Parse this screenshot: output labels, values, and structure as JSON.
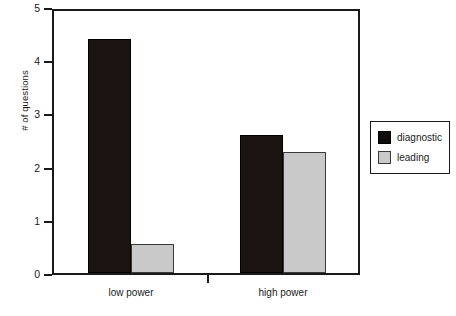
{
  "chart_data": {
    "type": "bar",
    "title": "",
    "xlabel": "",
    "ylabel": "# of questions",
    "categories": [
      "low power",
      "high power"
    ],
    "series": [
      {
        "name": "diagnostic",
        "values": [
          4.4,
          2.6
        ],
        "color": "#100c0a"
      },
      {
        "name": "leading",
        "values": [
          0.55,
          2.28
        ],
        "color": "#c9c9c9"
      }
    ],
    "ylim": [
      0,
      5
    ],
    "ytick_labels": [
      "5",
      "4",
      "3",
      "2",
      "1",
      "0"
    ],
    "ytick_values": [
      5,
      4,
      3,
      2,
      1,
      0
    ],
    "grid": false,
    "legend_position": "right",
    "legend_entries": [
      "diagnostic",
      "leading"
    ],
    "annotations": []
  },
  "axes": {
    "y_label": "# of questions",
    "y_ticks": [
      {
        "label": "5",
        "value": 5
      },
      {
        "label": "4",
        "value": 4
      },
      {
        "label": "3",
        "value": 3
      },
      {
        "label": "2",
        "value": 2
      },
      {
        "label": "1",
        "value": 1
      },
      {
        "label": "0",
        "value": 0
      }
    ],
    "x_groups": [
      {
        "label": "low power"
      },
      {
        "label": "high power"
      }
    ]
  },
  "legend": {
    "items": [
      {
        "label": "diagnostic",
        "swatch": "black-square-swatch"
      },
      {
        "label": "leading",
        "swatch": "gray-square-swatch"
      }
    ]
  }
}
